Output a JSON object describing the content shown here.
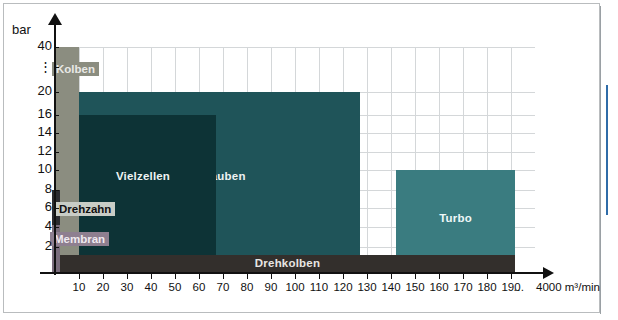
{
  "chart_data": {
    "type": "bar",
    "title": "",
    "orientation": "horizontal-ranges",
    "xlabel": "4000 m³/min",
    "ylabel": "bar",
    "xlim": [
      0,
      200
    ],
    "ylim": [
      0,
      40
    ],
    "grid": true,
    "x_ticks": [
      10,
      20,
      30,
      40,
      50,
      60,
      70,
      80,
      90,
      100,
      110,
      120,
      130,
      140,
      150,
      160,
      170,
      180,
      190
    ],
    "x_axis_break": "…",
    "x_axis_end_label": "4000 m³/min",
    "y_ticks": [
      "40",
      "⋮",
      "20",
      "16",
      "14",
      "12",
      "10",
      "8",
      "6",
      "4",
      "2"
    ],
    "y_unit": "bar",
    "series": [
      {
        "name": "Kolben",
        "x_start": 0,
        "x_end": 10,
        "y_min": 0,
        "y_max": 40,
        "color": "#8b8d80"
      },
      {
        "name": "Drehzahn",
        "x_start": 0,
        "x_end": 2,
        "y_min": 0,
        "y_max": 8,
        "color": "#2b2b30"
      },
      {
        "name": "Membran",
        "x_start": 0,
        "x_end": 2,
        "y_min": 0,
        "y_max": 5,
        "color": "#7a6d7c"
      },
      {
        "name": "Vielzellen",
        "x_start": 6,
        "x_end": 75,
        "y_min": 0,
        "y_max": 16,
        "color": "#0d3336"
      },
      {
        "name": "Schrauben",
        "x_start": 6,
        "x_end": 150,
        "y_min": 0,
        "y_max": 20,
        "color": "#1f5459"
      },
      {
        "name": "Turbo",
        "x_start": 150,
        "x_end": 200,
        "y_min": 0,
        "y_max": 10,
        "color": "#3a7c80"
      },
      {
        "name": "Drehkolben",
        "x_start": 2,
        "x_end": 192,
        "y_min": 0,
        "y_max": 2,
        "color": "#332f2c"
      }
    ]
  },
  "axis": {
    "y_unit": "bar",
    "y_labels": [
      "40",
      "⋮",
      "20",
      "16",
      "14",
      "12",
      "10",
      "8",
      "6",
      "4",
      "2"
    ],
    "x_labels": [
      "10",
      "20",
      "30",
      "40",
      "50",
      "60",
      "70",
      "80",
      "90",
      "100",
      "110",
      "120",
      "130",
      "140",
      "150",
      "160",
      "170",
      "180",
      "190"
    ],
    "x_break": "…",
    "x_unit": "4000 m³/min"
  },
  "bars": {
    "kolben": "Kolben",
    "drehzahn": "Drehzahn",
    "membran": "Membran",
    "vielzellen": "Vielzellen",
    "schrauben": "Schrauben",
    "turbo": "Turbo",
    "drehkolben": "Drehkolben"
  },
  "colors": {
    "kolben": "#8b8d80",
    "drehzahn": "#2b2b30",
    "membran": "#7a6d7c",
    "vielzellen": "#0d3336",
    "schrauben": "#1f5459",
    "turbo": "#3a7c80",
    "drehkolben": "#332f2c",
    "grid": "#d4d7d9",
    "axis": "#111111",
    "edge_strip": "#2f6ca8"
  }
}
